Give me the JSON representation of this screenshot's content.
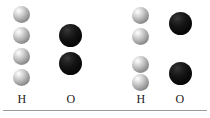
{
  "figure": {
    "title": "",
    "background_color": "#ffffff",
    "width": 210,
    "height": 118
  },
  "colors": {
    "hydrogen_sphere": "#b4b4b4",
    "oxygen_sphere": "#0a0a0a",
    "label_text": "#1b1b1b",
    "baseline_rule": "#9a9a9a"
  },
  "baseline": {
    "name": "horizontal-rule"
  },
  "groups": [
    {
      "id": "left",
      "columns": [
        {
          "id": "left-hydrogen",
          "label": "H",
          "element": "H",
          "sphere_type": "hydrogen",
          "count": 4,
          "sphere_diameter": 17,
          "center_x": 22,
          "label_x": 10,
          "spacing": "even",
          "sphere_tops": [
            6,
            27,
            48,
            69
          ]
        },
        {
          "id": "left-oxygen",
          "label": "O",
          "element": "O",
          "sphere_type": "oxygen",
          "count": 2,
          "sphere_diameter": 23,
          "center_x": 71,
          "label_x": 59,
          "spacing": "even",
          "sphere_tops": [
            24,
            52
          ]
        }
      ]
    },
    {
      "id": "right",
      "columns": [
        {
          "id": "right-hydrogen",
          "label": "H",
          "element": "H",
          "sphere_type": "hydrogen",
          "count": 4,
          "sphere_diameter": 17,
          "center_x": 141,
          "label_x": 129,
          "spacing": "paired",
          "sphere_tops": [
            7,
            28,
            56,
            74
          ]
        },
        {
          "id": "right-oxygen",
          "label": "O",
          "element": "O",
          "sphere_type": "oxygen",
          "count": 2,
          "sphere_diameter": 23,
          "center_x": 180,
          "label_x": 168,
          "spacing": "paired",
          "sphere_tops": [
            12,
            62
          ]
        }
      ]
    }
  ]
}
